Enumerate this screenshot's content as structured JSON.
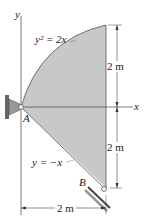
{
  "diagram": {
    "axes": {
      "x_label": "x",
      "y_label": "y"
    },
    "curves": {
      "upper": "y² = 2x",
      "lower": "y = −x"
    },
    "points": {
      "A": "A",
      "B": "B"
    },
    "dimensions": {
      "upper_height": "2 m",
      "lower_height": "2 m",
      "width": "2 m"
    },
    "colors": {
      "fill": "#c8c8c8",
      "line": "#333333"
    }
  }
}
